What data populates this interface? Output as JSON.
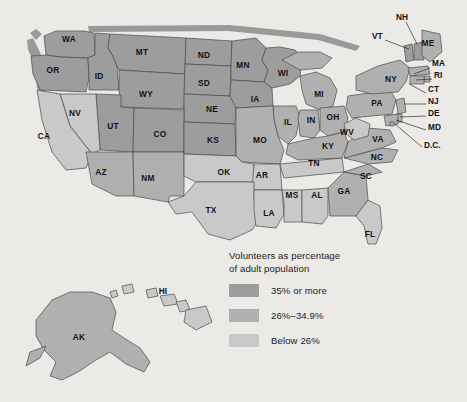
{
  "figure": {
    "background_color": "#eceae6"
  },
  "legend": {
    "title": "Volunteers as percentage\nof adult population",
    "items": [
      {
        "label": "35% or more",
        "color": "#9d9d9d",
        "key": "high"
      },
      {
        "label": "26%–34.9%",
        "color": "#b0b0b0",
        "key": "mid"
      },
      {
        "label": "Below 26%",
        "color": "#c9c9c9",
        "key": "low"
      }
    ]
  },
  "colors": {
    "high": "#9d9d9d",
    "mid": "#b0b0b0",
    "low": "#c9c9c9",
    "outline": "#4a4a4a",
    "shadow": "#8b8b8b",
    "text": "#111111"
  },
  "chart_data": {
    "type": "map",
    "title": "Volunteers as percentage of adult population",
    "categories": [
      "35% or more",
      "26%-34.9%",
      "Below 26%"
    ],
    "legend_position": "bottom-center",
    "regions": [
      {
        "code": "WA",
        "class": "high"
      },
      {
        "code": "OR",
        "class": "high"
      },
      {
        "code": "ID",
        "class": "high"
      },
      {
        "code": "MT",
        "class": "high"
      },
      {
        "code": "WY",
        "class": "high"
      },
      {
        "code": "UT",
        "class": "high"
      },
      {
        "code": "CO",
        "class": "high"
      },
      {
        "code": "NV",
        "class": "low"
      },
      {
        "code": "CA",
        "class": "low"
      },
      {
        "code": "AZ",
        "class": "mid"
      },
      {
        "code": "NM",
        "class": "mid"
      },
      {
        "code": "ND",
        "class": "high"
      },
      {
        "code": "SD",
        "class": "high"
      },
      {
        "code": "NE",
        "class": "high"
      },
      {
        "code": "KS",
        "class": "high"
      },
      {
        "code": "MN",
        "class": "high"
      },
      {
        "code": "IA",
        "class": "high"
      },
      {
        "code": "WI",
        "class": "high"
      },
      {
        "code": "MO",
        "class": "mid"
      },
      {
        "code": "IL",
        "class": "mid"
      },
      {
        "code": "MI",
        "class": "mid"
      },
      {
        "code": "IN",
        "class": "mid"
      },
      {
        "code": "OH",
        "class": "mid"
      },
      {
        "code": "OK",
        "class": "low"
      },
      {
        "code": "TX",
        "class": "low"
      },
      {
        "code": "AR",
        "class": "low"
      },
      {
        "code": "LA",
        "class": "low"
      },
      {
        "code": "MS",
        "class": "low"
      },
      {
        "code": "AL",
        "class": "low"
      },
      {
        "code": "TN",
        "class": "low"
      },
      {
        "code": "KY",
        "class": "mid"
      },
      {
        "code": "GA",
        "class": "mid"
      },
      {
        "code": "SC",
        "class": "mid"
      },
      {
        "code": "FL",
        "class": "low"
      },
      {
        "code": "NC",
        "class": "mid"
      },
      {
        "code": "VA",
        "class": "mid"
      },
      {
        "code": "WV",
        "class": "low"
      },
      {
        "code": "PA",
        "class": "mid"
      },
      {
        "code": "NY",
        "class": "mid"
      },
      {
        "code": "VT",
        "class": "high"
      },
      {
        "code": "NH",
        "class": "high"
      },
      {
        "code": "ME",
        "class": "mid"
      },
      {
        "code": "MA",
        "class": "mid"
      },
      {
        "code": "RI",
        "class": "mid"
      },
      {
        "code": "CT",
        "class": "mid"
      },
      {
        "code": "NJ",
        "class": "mid"
      },
      {
        "code": "DE",
        "class": "mid"
      },
      {
        "code": "MD",
        "class": "mid"
      },
      {
        "code": "D.C.",
        "class": "mid"
      },
      {
        "code": "AK",
        "class": "mid"
      },
      {
        "code": "HI",
        "class": "low"
      }
    ]
  },
  "map_labels": {
    "inline": [
      {
        "code": "WA",
        "x": 69,
        "y": 40
      },
      {
        "code": "OR",
        "x": 53,
        "y": 71
      },
      {
        "code": "ID",
        "x": 99,
        "y": 77
      },
      {
        "code": "MT",
        "x": 142,
        "y": 53
      },
      {
        "code": "ND",
        "x": 204,
        "y": 56
      },
      {
        "code": "MN",
        "x": 243,
        "y": 66
      },
      {
        "code": "WI",
        "x": 283,
        "y": 74
      },
      {
        "code": "SD",
        "x": 204,
        "y": 84
      },
      {
        "code": "WY",
        "x": 146,
        "y": 95
      },
      {
        "code": "NV",
        "x": 75,
        "y": 114
      },
      {
        "code": "UT",
        "x": 113,
        "y": 127
      },
      {
        "code": "CO",
        "x": 160,
        "y": 135
      },
      {
        "code": "NE",
        "x": 212,
        "y": 110
      },
      {
        "code": "IA",
        "x": 255,
        "y": 100
      },
      {
        "code": "MI",
        "x": 319,
        "y": 95
      },
      {
        "code": "IL",
        "x": 288,
        "y": 123
      },
      {
        "code": "IN",
        "x": 311,
        "y": 121
      },
      {
        "code": "OH",
        "x": 333,
        "y": 118
      },
      {
        "code": "KS",
        "x": 213,
        "y": 141
      },
      {
        "code": "MO",
        "x": 260,
        "y": 141
      },
      {
        "code": "CA",
        "x": 44,
        "y": 137
      },
      {
        "code": "AZ",
        "x": 101,
        "y": 173
      },
      {
        "code": "NM",
        "x": 148,
        "y": 179
      },
      {
        "code": "OK",
        "x": 224,
        "y": 173
      },
      {
        "code": "AR",
        "x": 262,
        "y": 176
      },
      {
        "code": "KY",
        "x": 328,
        "y": 147
      },
      {
        "code": "TN",
        "x": 314,
        "y": 164
      },
      {
        "code": "WV",
        "x": 347,
        "y": 133
      },
      {
        "code": "VA",
        "x": 378,
        "y": 140
      },
      {
        "code": "NC",
        "x": 377,
        "y": 158
      },
      {
        "code": "SC",
        "x": 366,
        "y": 177
      },
      {
        "code": "GA",
        "x": 344,
        "y": 192
      },
      {
        "code": "AL",
        "x": 317,
        "y": 196
      },
      {
        "code": "MS",
        "x": 292,
        "y": 196
      },
      {
        "code": "LA",
        "x": 269,
        "y": 214
      },
      {
        "code": "TX",
        "x": 211,
        "y": 211
      },
      {
        "code": "FL",
        "x": 370,
        "y": 235
      },
      {
        "code": "PA",
        "x": 377,
        "y": 104
      },
      {
        "code": "NY",
        "x": 391,
        "y": 80
      },
      {
        "code": "ME",
        "x": 428,
        "y": 44
      },
      {
        "code": "HI",
        "x": 163,
        "y": 292
      },
      {
        "code": "AK",
        "x": 79,
        "y": 338
      }
    ],
    "callouts": [
      {
        "code": "NH",
        "x": 396,
        "y": 18,
        "lx1": 406,
        "ly1": 22,
        "lx2": 417,
        "ly2": 44
      },
      {
        "code": "VT",
        "x": 372,
        "y": 37,
        "lx1": 385,
        "ly1": 40,
        "lx2": 409,
        "ly2": 49
      },
      {
        "code": "MA",
        "x": 432,
        "y": 64,
        "lx1": 430,
        "ly1": 68,
        "lx2": 414,
        "ly2": 74
      },
      {
        "code": "RI",
        "x": 434,
        "y": 76,
        "lx1": 432,
        "ly1": 79,
        "lx2": 416,
        "ly2": 80
      },
      {
        "code": "CT",
        "x": 428,
        "y": 90,
        "lx1": 426,
        "ly1": 93,
        "lx2": 409,
        "ly2": 84
      },
      {
        "code": "NJ",
        "x": 428,
        "y": 102,
        "lx1": 426,
        "ly1": 104,
        "lx2": 404,
        "ly2": 104
      },
      {
        "code": "DE",
        "x": 428,
        "y": 114,
        "lx1": 426,
        "ly1": 116,
        "lx2": 400,
        "ly2": 117
      },
      {
        "code": "MD",
        "x": 428,
        "y": 128,
        "lx1": 426,
        "ly1": 130,
        "lx2": 396,
        "ly2": 120
      },
      {
        "code": "D.C.",
        "x": 424,
        "y": 146,
        "lx1": 422,
        "ly1": 147,
        "lx2": 395,
        "ly2": 124
      }
    ]
  }
}
